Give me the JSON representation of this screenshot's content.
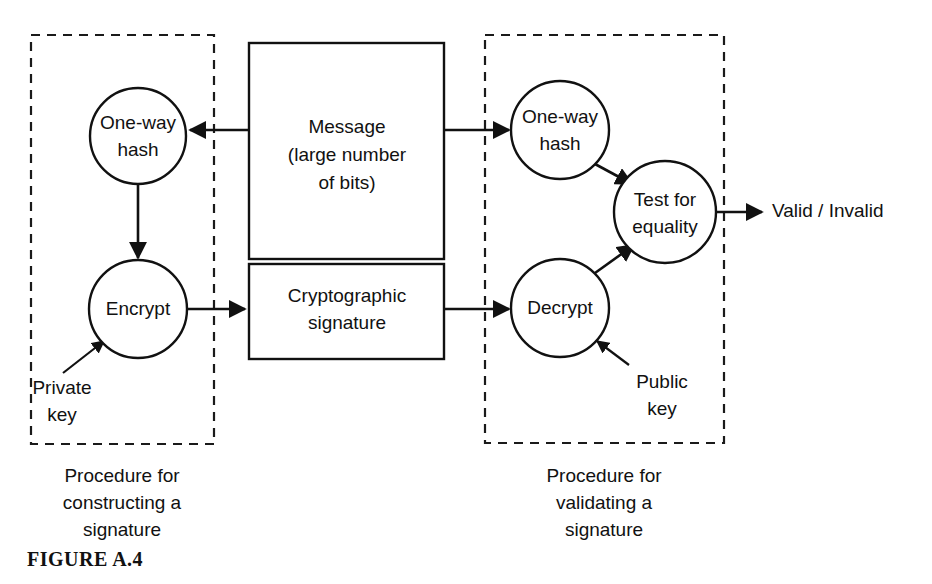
{
  "figure": {
    "label": "FIGURE A.4",
    "background_color": "#ffffff",
    "line_color": "#111111"
  },
  "nodes": {
    "hash_left": {
      "line1": "One-way",
      "line2": "hash"
    },
    "encrypt": {
      "line1": "Encrypt"
    },
    "hash_right": {
      "line1": "One-way",
      "line2": "hash"
    },
    "decrypt": {
      "line1": "Decrypt"
    },
    "test_equality": {
      "line1": "Test for",
      "line2": "equality"
    }
  },
  "boxes": {
    "message": {
      "line1": "Message",
      "line2": "(large number",
      "line3": "of bits)"
    },
    "signature": {
      "line1": "Cryptographic",
      "line2": "signature"
    }
  },
  "labels": {
    "private_key": {
      "line1": "Private",
      "line2": "key"
    },
    "public_key": {
      "line1": "Public",
      "line2": "key"
    },
    "output": "Valid / Invalid"
  },
  "captions": {
    "left": {
      "line1": "Procedure for",
      "line2": "constructing a",
      "line3": "signature"
    },
    "right": {
      "line1": "Procedure for",
      "line2": "validating a",
      "line3": "signature"
    }
  }
}
